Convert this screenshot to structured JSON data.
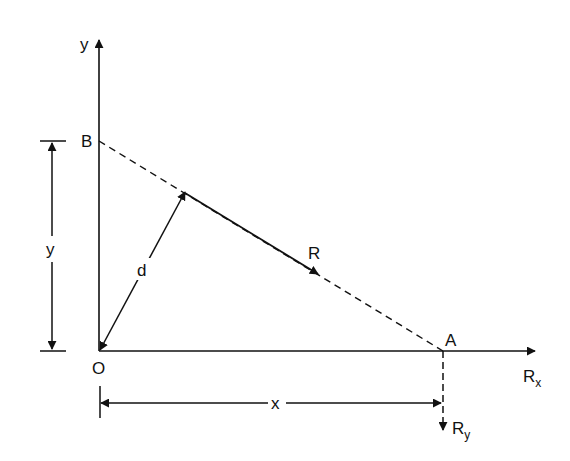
{
  "diagram": {
    "type": "force-resultant-intercepts",
    "stroke_color": "#111111",
    "background": "#ffffff",
    "points": {
      "O": {
        "label": "O",
        "x": 99,
        "y": 351
      },
      "B": {
        "label": "B",
        "x": 99,
        "y": 141
      },
      "A": {
        "label": "A",
        "x": 443,
        "y": 351
      },
      "foot": {
        "x": 185,
        "y": 190
      },
      "R_head": {
        "x": 318,
        "y": 274
      }
    },
    "axes": {
      "y_axis": {
        "label": "y"
      },
      "x_axis": {
        "label": "R",
        "subscript": "x"
      }
    },
    "labels": {
      "O": "O",
      "B": "B",
      "A": "A",
      "R": "R",
      "d": "d",
      "y_dim": "y",
      "x_dim": "x",
      "y_axis": "y",
      "Rx_main": "R",
      "Rx_sub": "x",
      "Ry_main": "R",
      "Ry_sub": "y"
    },
    "dimensions": {
      "y": {
        "label": "y",
        "from": "B",
        "to": "O"
      },
      "x": {
        "label": "x",
        "from": "O",
        "to": "A"
      }
    },
    "vectors": {
      "R": {
        "label": "R",
        "style": "solid",
        "on_line": "BA"
      },
      "d": {
        "label": "d",
        "style": "solid-double-arrow",
        "perpendicular_to": "BA"
      },
      "Ry": {
        "label": "R",
        "subscript": "y",
        "style": "dashed",
        "direction": "down"
      },
      "line_BA": {
        "style": "dashed"
      }
    }
  }
}
